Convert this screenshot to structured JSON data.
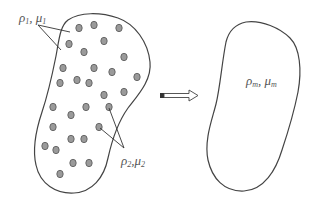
{
  "diagram": {
    "title": "",
    "left_region": {
      "name": "heterogeneous-medium",
      "matrix_label": {
        "symbol1": "ρ",
        "sub1": "1",
        "sep": ", ",
        "symbol2": "μ",
        "sub2": "1"
      },
      "inclusion_label": {
        "symbol1": "ρ",
        "sub1": "2",
        "sep": ",",
        "symbol2": "μ",
        "sub2": "2"
      },
      "inclusion_count": 29,
      "inclusion_color": "#9a9a9a"
    },
    "arrow": {
      "direction": "right",
      "meaning": "homogenization"
    },
    "right_region": {
      "name": "effective-medium",
      "label": {
        "symbol1": "ρ",
        "sub1": "m",
        "sep": ", ",
        "symbol2": "μ",
        "sub2": "m"
      }
    },
    "colors": {
      "stroke": "#444444",
      "text": "#555555",
      "dot_fill": "#9a9a9a",
      "dot_stroke": "#555555"
    }
  }
}
